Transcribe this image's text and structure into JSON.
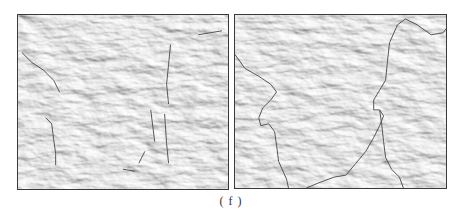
{
  "figure": {
    "caption": "( f )",
    "panels": [
      {
        "id": "left",
        "description": "shaded relief terrain map with fragmentary dark line segments"
      },
      {
        "id": "right",
        "description": "shaded relief terrain map with continuous dark boundary line"
      }
    ],
    "colors": {
      "terrain_base": "#cfcfcf",
      "terrain_light": "#e6e6e6",
      "terrain_dark": "#a8a8a8",
      "boundary_line": "#555555",
      "frame": "#3a3a3a"
    }
  }
}
